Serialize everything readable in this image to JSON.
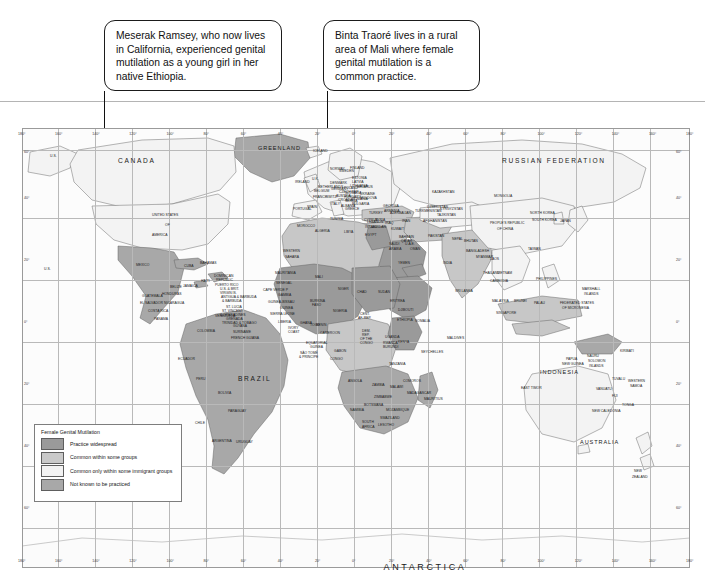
{
  "page": {
    "divider_color": "#b4b4b4"
  },
  "callouts": [
    {
      "id": "callout-meserak",
      "text": "Meserak Ramsey, who now lives in California, experienced genital mutilation as a young girl in her native Ethiopia.",
      "points_to": "United States / California"
    },
    {
      "id": "callout-binta",
      "text": "Binta Traoré lives in a rural area of Mali where female genital mutilation is a common practice.",
      "points_to": "Mali"
    }
  ],
  "legend": {
    "title": "Female Genital Mutilation",
    "items": [
      {
        "label": "Practice widespread",
        "color": "#9a9a9a"
      },
      {
        "label": "Common within some groups",
        "color": "#c9c9c9"
      },
      {
        "label": "Common only within some immigrant groups",
        "color": "#f2f2f2"
      },
      {
        "label": "Not known to be practiced",
        "color": "#a8a8a8"
      }
    ]
  },
  "graticule": {
    "longitude_labels": [
      "180°",
      "160°",
      "140°",
      "120°",
      "100°",
      "80°",
      "60°",
      "40°",
      "20°",
      "0°",
      "20°",
      "40°",
      "60°",
      "80°",
      "100°",
      "120°",
      "140°",
      "160°",
      "180°"
    ],
    "latitude_labels_left": [
      "60°",
      "40°",
      "20°",
      "0°",
      "20°",
      "40°",
      "60°"
    ],
    "latitude_labels_right": [
      "60°",
      "40°",
      "20°",
      "0°",
      "20°",
      "40°",
      "60°"
    ]
  },
  "map_labels": {
    "oceans_continents": [
      {
        "name": "ANTARCTICA",
        "x": 425,
        "y": 563,
        "size": "t9"
      }
    ],
    "majors": [
      {
        "name": "CANADA",
        "x": 118,
        "y": 158,
        "size": "t6",
        "cls": "sp2"
      },
      {
        "name": "GREENLAND",
        "x": 258,
        "y": 146,
        "size": "t5",
        "cls": "sp1"
      },
      {
        "name": "RUSSIAN FEDERATION",
        "x": 502,
        "y": 158,
        "size": "t6",
        "cls": "sp2"
      },
      {
        "name": "BRAZIL",
        "x": 238,
        "y": 376,
        "size": "t6",
        "cls": "sp2"
      },
      {
        "name": "AUSTRALIA",
        "x": 580,
        "y": 440,
        "size": "t5",
        "cls": "sp1"
      },
      {
        "name": "INDONESIA",
        "x": 540,
        "y": 370,
        "size": "t5",
        "cls": "sp1"
      }
    ],
    "countries": [
      {
        "name": "U.S.",
        "x": 50,
        "y": 155
      },
      {
        "name": "U.S.",
        "x": 44,
        "y": 268
      },
      {
        "name": "UNITED STATES",
        "x": 152,
        "y": 214
      },
      {
        "name": "OF",
        "x": 165,
        "y": 224
      },
      {
        "name": "AMERICA",
        "x": 152,
        "y": 234
      },
      {
        "name": "ICELAND",
        "x": 313,
        "y": 150
      },
      {
        "name": "IRELAND",
        "x": 295,
        "y": 181
      },
      {
        "name": "U.K.",
        "x": 312,
        "y": 178
      },
      {
        "name": "NORWAY",
        "x": 330,
        "y": 168
      },
      {
        "name": "SWEDEN",
        "x": 339,
        "y": 170
      },
      {
        "name": "FINLAND",
        "x": 350,
        "y": 167
      },
      {
        "name": "ESTONIA",
        "x": 352,
        "y": 177
      },
      {
        "name": "LATVIA",
        "x": 352,
        "y": 181
      },
      {
        "name": "LITHUANIA",
        "x": 350,
        "y": 185
      },
      {
        "name": "DENMARK",
        "x": 330,
        "y": 182
      },
      {
        "name": "NETHERLANDS",
        "x": 318,
        "y": 186
      },
      {
        "name": "BELGIUM",
        "x": 314,
        "y": 190
      },
      {
        "name": "GERMANY",
        "x": 331,
        "y": 188
      },
      {
        "name": "POLAND",
        "x": 344,
        "y": 187
      },
      {
        "name": "BELARUS",
        "x": 357,
        "y": 186
      },
      {
        "name": "UKRAINE",
        "x": 360,
        "y": 193
      },
      {
        "name": "FRANCE",
        "x": 313,
        "y": 196
      },
      {
        "name": "SWITZ.",
        "x": 326,
        "y": 196
      },
      {
        "name": "AUSTRIA",
        "x": 336,
        "y": 195
      },
      {
        "name": "CZECH REP.",
        "x": 339,
        "y": 191
      },
      {
        "name": "SLOVAKIA",
        "x": 345,
        "y": 192
      },
      {
        "name": "HUNGARY",
        "x": 344,
        "y": 196
      },
      {
        "name": "ROMANIA",
        "x": 352,
        "y": 198
      },
      {
        "name": "MOLDOVA",
        "x": 360,
        "y": 197
      },
      {
        "name": "CROATIA",
        "x": 338,
        "y": 199
      },
      {
        "name": "SERBIA",
        "x": 345,
        "y": 200
      },
      {
        "name": "BULGARIA",
        "x": 352,
        "y": 203
      },
      {
        "name": "ITALY",
        "x": 331,
        "y": 203
      },
      {
        "name": "SPAIN",
        "x": 307,
        "y": 206
      },
      {
        "name": "PORTUGAL",
        "x": 293,
        "y": 208
      },
      {
        "name": "GREECE",
        "x": 345,
        "y": 208
      },
      {
        "name": "ALBANIA",
        "x": 341,
        "y": 205
      },
      {
        "name": "TURKEY",
        "x": 369,
        "y": 212
      },
      {
        "name": "GEORGIA",
        "x": 383,
        "y": 205
      },
      {
        "name": "ARMENIA",
        "x": 384,
        "y": 210
      },
      {
        "name": "AZERBAIJAN",
        "x": 390,
        "y": 212
      },
      {
        "name": "CYPRUS",
        "x": 364,
        "y": 219
      },
      {
        "name": "SYRIA",
        "x": 375,
        "y": 219
      },
      {
        "name": "LEBANON",
        "x": 367,
        "y": 221
      },
      {
        "name": "ISRAEL",
        "x": 365,
        "y": 226
      },
      {
        "name": "JORDAN",
        "x": 372,
        "y": 226
      },
      {
        "name": "IRAQ",
        "x": 385,
        "y": 222
      },
      {
        "name": "IRAN",
        "x": 402,
        "y": 220
      },
      {
        "name": "KUWAIT",
        "x": 391,
        "y": 228
      },
      {
        "name": "SAUDI",
        "x": 389,
        "y": 243
      },
      {
        "name": "ARABIA",
        "x": 389,
        "y": 248
      },
      {
        "name": "BAHRAIN",
        "x": 399,
        "y": 236
      },
      {
        "name": "QATAR",
        "x": 401,
        "y": 240
      },
      {
        "name": "U.A.E.",
        "x": 405,
        "y": 243
      },
      {
        "name": "OMAN",
        "x": 410,
        "y": 248
      },
      {
        "name": "YEMEN",
        "x": 398,
        "y": 262
      },
      {
        "name": "MOROCCO",
        "x": 297,
        "y": 225
      },
      {
        "name": "ALGERIA",
        "x": 315,
        "y": 230
      },
      {
        "name": "TUNISIA",
        "x": 330,
        "y": 218
      },
      {
        "name": "LIBYA",
        "x": 344,
        "y": 231
      },
      {
        "name": "EGYPT",
        "x": 365,
        "y": 234
      },
      {
        "name": "WESTERN",
        "x": 283,
        "y": 250
      },
      {
        "name": "SAHARA",
        "x": 285,
        "y": 256
      },
      {
        "name": "MAURITANIA",
        "x": 275,
        "y": 272
      },
      {
        "name": "SENEGAL",
        "x": 276,
        "y": 282
      },
      {
        "name": "CAPE VERDE P",
        "x": 263,
        "y": 289
      },
      {
        "name": "GAMBIA",
        "x": 278,
        "y": 294
      },
      {
        "name": "GUINEA-BISSAU",
        "x": 268,
        "y": 301
      },
      {
        "name": "GUINEA",
        "x": 280,
        "y": 307
      },
      {
        "name": "SIERRA LEONE",
        "x": 270,
        "y": 313
      },
      {
        "name": "LIBERIA",
        "x": 278,
        "y": 321
      },
      {
        "name": "IVORY",
        "x": 288,
        "y": 327
      },
      {
        "name": "COAST",
        "x": 288,
        "y": 331
      },
      {
        "name": "MALI",
        "x": 315,
        "y": 276
      },
      {
        "name": "NIGER",
        "x": 338,
        "y": 288
      },
      {
        "name": "BURKINA",
        "x": 310,
        "y": 300
      },
      {
        "name": "FASO",
        "x": 312,
        "y": 304
      },
      {
        "name": "TOGO",
        "x": 310,
        "y": 324
      },
      {
        "name": "BENIN",
        "x": 316,
        "y": 324
      },
      {
        "name": "GHANA",
        "x": 300,
        "y": 322
      },
      {
        "name": "NIGERIA",
        "x": 333,
        "y": 310
      },
      {
        "name": "CHAD",
        "x": 357,
        "y": 291
      },
      {
        "name": "SUDAN",
        "x": 378,
        "y": 291
      },
      {
        "name": "ERITREA",
        "x": 390,
        "y": 300
      },
      {
        "name": "DJIBOUTI",
        "x": 398,
        "y": 309
      },
      {
        "name": "ETHIOPIA",
        "x": 397,
        "y": 319
      },
      {
        "name": "SOMALIA",
        "x": 415,
        "y": 320
      },
      {
        "name": "KENYA",
        "x": 398,
        "y": 341
      },
      {
        "name": "UGANDA",
        "x": 385,
        "y": 336
      },
      {
        "name": "RWANDA",
        "x": 383,
        "y": 342
      },
      {
        "name": "BURUNDI",
        "x": 383,
        "y": 346
      },
      {
        "name": "TANZANIA",
        "x": 389,
        "y": 363
      },
      {
        "name": "CENT.",
        "x": 360,
        "y": 313
      },
      {
        "name": "AF. REP.",
        "x": 358,
        "y": 317
      },
      {
        "name": "CAMEROON",
        "x": 320,
        "y": 332
      },
      {
        "name": "EQUATORIAL",
        "x": 306,
        "y": 342
      },
      {
        "name": "GUINEA",
        "x": 310,
        "y": 346
      },
      {
        "name": "SÃO TOMÉ",
        "x": 300,
        "y": 352
      },
      {
        "name": "& PRÍNCIPE",
        "x": 299,
        "y": 356
      },
      {
        "name": "GABON",
        "x": 334,
        "y": 350
      },
      {
        "name": "CONGO",
        "x": 330,
        "y": 358
      },
      {
        "name": "DEM.",
        "x": 362,
        "y": 330
      },
      {
        "name": "REP.",
        "x": 362,
        "y": 334
      },
      {
        "name": "OF THE",
        "x": 360,
        "y": 338
      },
      {
        "name": "CONGO",
        "x": 360,
        "y": 342
      },
      {
        "name": "ANGOLA",
        "x": 348,
        "y": 380
      },
      {
        "name": "ZAMBIA",
        "x": 372,
        "y": 384
      },
      {
        "name": "MALAWI",
        "x": 390,
        "y": 386
      },
      {
        "name": "MOZAMBIQUE",
        "x": 386,
        "y": 409
      },
      {
        "name": "ZIMBABWE",
        "x": 374,
        "y": 396
      },
      {
        "name": "BOTSWANA",
        "x": 364,
        "y": 404
      },
      {
        "name": "NAMIBIA",
        "x": 350,
        "y": 409
      },
      {
        "name": "SOUTH",
        "x": 362,
        "y": 421
      },
      {
        "name": "AFRICA",
        "x": 362,
        "y": 426
      },
      {
        "name": "SWAZILAND",
        "x": 380,
        "y": 417
      },
      {
        "name": "LESOTHO",
        "x": 378,
        "y": 424
      },
      {
        "name": "MADAGASCAR",
        "x": 407,
        "y": 392
      },
      {
        "name": "COMOROS",
        "x": 403,
        "y": 380
      },
      {
        "name": "MAURITIUS",
        "x": 424,
        "y": 398
      },
      {
        "name": "SEYCHELLES",
        "x": 421,
        "y": 351
      },
      {
        "name": "MALDIVES",
        "x": 447,
        "y": 337
      },
      {
        "name": "MEXICO",
        "x": 136,
        "y": 264
      },
      {
        "name": "CUBA",
        "x": 184,
        "y": 265
      },
      {
        "name": "BAHAMAS",
        "x": 200,
        "y": 262
      },
      {
        "name": "JAMAICA",
        "x": 183,
        "y": 285
      },
      {
        "name": "HAITI",
        "x": 201,
        "y": 280
      },
      {
        "name": "DOMINICAN",
        "x": 214,
        "y": 275
      },
      {
        "name": "REPUBLIC",
        "x": 216,
        "y": 279
      },
      {
        "name": "PUERTO RICO",
        "x": 215,
        "y": 284
      },
      {
        "name": "U.S. & BRIT.",
        "x": 220,
        "y": 288
      },
      {
        "name": "VIRGIN IS.",
        "x": 220,
        "y": 292
      },
      {
        "name": "ANTIGUA & BARBUDA",
        "x": 221,
        "y": 296
      },
      {
        "name": "& BARBUDA",
        "x": 222,
        "y": 300
      },
      {
        "name": "ST. LUCIA",
        "x": 226,
        "y": 306
      },
      {
        "name": "ST. VINCENT",
        "x": 222,
        "y": 310
      },
      {
        "name": "& GRENADINES",
        "x": 220,
        "y": 314
      },
      {
        "name": "GRENADA",
        "x": 226,
        "y": 318
      },
      {
        "name": "TRINIDAD & TOBAGO",
        "x": 222,
        "y": 322
      },
      {
        "name": "BELIZE",
        "x": 170,
        "y": 286
      },
      {
        "name": "GUATEMALA",
        "x": 142,
        "y": 295
      },
      {
        "name": "HONDURAS",
        "x": 162,
        "y": 293
      },
      {
        "name": "EL SALVADOR",
        "x": 140,
        "y": 302
      },
      {
        "name": "NICARAGUA",
        "x": 164,
        "y": 302
      },
      {
        "name": "COSTA RICA",
        "x": 148,
        "y": 310
      },
      {
        "name": "PANAMA",
        "x": 154,
        "y": 318
      },
      {
        "name": "VENEZUELA",
        "x": 215,
        "y": 315
      },
      {
        "name": "COLOMBIA",
        "x": 197,
        "y": 330
      },
      {
        "name": "GUYANA",
        "x": 233,
        "y": 325
      },
      {
        "name": "SURINAME",
        "x": 233,
        "y": 331
      },
      {
        "name": "FRENCH GUIANA",
        "x": 231,
        "y": 337
      },
      {
        "name": "ECUADOR",
        "x": 178,
        "y": 358
      },
      {
        "name": "PERU",
        "x": 196,
        "y": 378
      },
      {
        "name": "BOLIVIA",
        "x": 218,
        "y": 392
      },
      {
        "name": "PARAGUAY",
        "x": 228,
        "y": 410
      },
      {
        "name": "CHILE",
        "x": 195,
        "y": 422
      },
      {
        "name": "ARGENTINA",
        "x": 212,
        "y": 440
      },
      {
        "name": "URUGUAY",
        "x": 236,
        "y": 441
      },
      {
        "name": "KAZAKHSTAN",
        "x": 432,
        "y": 191
      },
      {
        "name": "UZBEKISTAN",
        "x": 427,
        "y": 206
      },
      {
        "name": "TURKMENISTAN",
        "x": 415,
        "y": 210
      },
      {
        "name": "KYRGYZSTAN",
        "x": 440,
        "y": 208
      },
      {
        "name": "TAJIKISTAN",
        "x": 437,
        "y": 214
      },
      {
        "name": "AFGHANISTAN",
        "x": 423,
        "y": 220
      },
      {
        "name": "PAKISTAN",
        "x": 428,
        "y": 235
      },
      {
        "name": "MONGOLIA",
        "x": 494,
        "y": 195
      },
      {
        "name": "PEOPLE'S REPUBLIC",
        "x": 490,
        "y": 222
      },
      {
        "name": "OF CHINA",
        "x": 497,
        "y": 228
      },
      {
        "name": "NEPAL",
        "x": 452,
        "y": 238
      },
      {
        "name": "BHUTAN",
        "x": 464,
        "y": 240
      },
      {
        "name": "INDIA",
        "x": 443,
        "y": 262
      },
      {
        "name": "BANGLADESH",
        "x": 466,
        "y": 250
      },
      {
        "name": "MYANMAR",
        "x": 476,
        "y": 256
      },
      {
        "name": "SRI LANKA",
        "x": 455,
        "y": 290
      },
      {
        "name": "THAILAND",
        "x": 483,
        "y": 272
      },
      {
        "name": "LAOS",
        "x": 490,
        "y": 258
      },
      {
        "name": "VIETNAM",
        "x": 497,
        "y": 272
      },
      {
        "name": "CAMBODIA",
        "x": 490,
        "y": 280
      },
      {
        "name": "MALAYSIA",
        "x": 492,
        "y": 300
      },
      {
        "name": "SINGAPORE",
        "x": 496,
        "y": 312
      },
      {
        "name": "BRUNEI",
        "x": 514,
        "y": 300
      },
      {
        "name": "PHILIPPINES",
        "x": 536,
        "y": 278
      },
      {
        "name": "NORTH KOREA",
        "x": 530,
        "y": 212
      },
      {
        "name": "SOUTH KOREA",
        "x": 532,
        "y": 219
      },
      {
        "name": "JAPAN",
        "x": 560,
        "y": 220
      },
      {
        "name": "TAIWAN",
        "x": 528,
        "y": 248
      },
      {
        "name": "FEDERATED STATES",
        "x": 560,
        "y": 302
      },
      {
        "name": "OF MICRONESIA",
        "x": 562,
        "y": 307
      },
      {
        "name": "MARSHALL",
        "x": 582,
        "y": 288
      },
      {
        "name": "ISLANDS",
        "x": 584,
        "y": 293
      },
      {
        "name": "PALAU",
        "x": 534,
        "y": 302
      },
      {
        "name": "EAST TIMOR",
        "x": 521,
        "y": 387
      },
      {
        "name": "PAPUA",
        "x": 566,
        "y": 358
      },
      {
        "name": "NEW GUINEA",
        "x": 562,
        "y": 363
      },
      {
        "name": "SOLOMON",
        "x": 588,
        "y": 360
      },
      {
        "name": "ISLANDS",
        "x": 589,
        "y": 365
      },
      {
        "name": "NAURU",
        "x": 587,
        "y": 355
      },
      {
        "name": "KIRIBATI",
        "x": 620,
        "y": 350
      },
      {
        "name": "TUVALU",
        "x": 612,
        "y": 378
      },
      {
        "name": "VANUATU",
        "x": 596,
        "y": 388
      },
      {
        "name": "FIJI",
        "x": 612,
        "y": 395
      },
      {
        "name": "WESTERN",
        "x": 628,
        "y": 380
      },
      {
        "name": "SAMOA",
        "x": 630,
        "y": 385
      },
      {
        "name": "TONGA",
        "x": 622,
        "y": 404
      },
      {
        "name": "NEW CALEDONIA",
        "x": 592,
        "y": 410
      },
      {
        "name": "NEW",
        "x": 634,
        "y": 470
      },
      {
        "name": "ZEALAND",
        "x": 632,
        "y": 476
      }
    ]
  }
}
